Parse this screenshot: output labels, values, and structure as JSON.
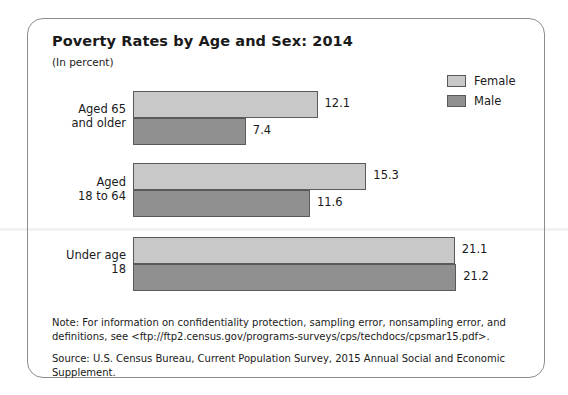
{
  "figure": {
    "title": "Poverty Rates by Age and Sex: 2014",
    "subtitle": "(In percent)",
    "note": "Note: For information on confidentiality protection, sampling error, nonsampling error, and definitions, see <ftp://ftp2.census.gov/programs-surveys/cps/techdocs/cpsmar15.pdf>.",
    "source": "Source: U.S. Census Bureau, Current Population Survey, 2015 Annual Social and Economic Supplement."
  },
  "legend": {
    "items": [
      {
        "label": "Female",
        "color": "#c8c8c8"
      },
      {
        "label": "Male",
        "color": "#909090"
      }
    ]
  },
  "chart_data": {
    "type": "bar",
    "orientation": "horizontal",
    "title": "Poverty Rates by Age and Sex: 2014",
    "subtitle": "(In percent)",
    "xlabel": "",
    "ylabel": "",
    "unit": "percent",
    "grid": false,
    "legend_position": "top-right",
    "xlim": [
      0,
      22
    ],
    "categories": [
      "Aged 65 and older",
      "Aged 18 to 64",
      "Under age 18"
    ],
    "category_labels": [
      "Aged 65\nand older",
      "Aged\n18 to 64",
      "Under age\n18"
    ],
    "series": [
      {
        "name": "Female",
        "color": "#c8c8c8",
        "values": [
          12.1,
          15.3,
          21.1
        ]
      },
      {
        "name": "Male",
        "color": "#909090",
        "values": [
          7.4,
          11.6,
          21.2
        ]
      }
    ],
    "value_labels": [
      [
        "12.1",
        "7.4"
      ],
      [
        "15.3",
        "11.6"
      ],
      [
        "21.1",
        "21.2"
      ]
    ]
  }
}
